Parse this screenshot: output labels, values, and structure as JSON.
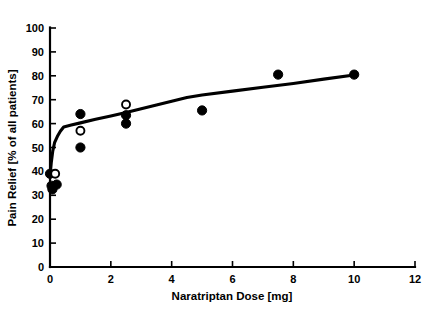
{
  "chart_data": {
    "type": "scatter",
    "title": "",
    "xlabel": "Naratriptan Dose [mg]",
    "ylabel": "Pain Relief [% of all patients]",
    "xlim": [
      0,
      12
    ],
    "ylim": [
      0,
      100
    ],
    "xticks": [
      0,
      2,
      4,
      6,
      8,
      10,
      12
    ],
    "yticks": [
      0,
      10,
      20,
      30,
      40,
      50,
      60,
      70,
      80,
      90,
      100
    ],
    "xtick_labels": [
      "0",
      "2",
      "4",
      "6",
      "8",
      "10",
      "12"
    ],
    "ytick_labels": [
      "0",
      "10",
      "20",
      "30",
      "40",
      "50",
      "60",
      "70",
      "80",
      "90",
      "100"
    ],
    "grid": false,
    "legend": null,
    "series": [
      {
        "name": "filled-circles",
        "marker": "filled-circle",
        "points": [
          {
            "x": 0.0,
            "y": 39.0
          },
          {
            "x": 0.05,
            "y": 34.0
          },
          {
            "x": 0.08,
            "y": 32.5
          },
          {
            "x": 0.22,
            "y": 34.5
          },
          {
            "x": 1.0,
            "y": 64.0
          },
          {
            "x": 1.0,
            "y": 50.0
          },
          {
            "x": 2.5,
            "y": 63.5
          },
          {
            "x": 2.5,
            "y": 60.0
          },
          {
            "x": 5.0,
            "y": 65.5
          },
          {
            "x": 7.5,
            "y": 80.5
          },
          {
            "x": 10.0,
            "y": 80.5
          }
        ]
      },
      {
        "name": "open-circles",
        "marker": "open-circle",
        "points": [
          {
            "x": 0.17,
            "y": 39.0
          },
          {
            "x": 1.0,
            "y": 57.0
          },
          {
            "x": 2.5,
            "y": 68.0
          }
        ]
      }
    ],
    "fit_curve": {
      "name": "fitted-dose-response-curve",
      "points": [
        {
          "x": 0.0,
          "y": 38.0
        },
        {
          "x": 0.04,
          "y": 43.5
        },
        {
          "x": 0.09,
          "y": 48.5
        },
        {
          "x": 0.15,
          "y": 52.0
        },
        {
          "x": 0.24,
          "y": 54.6
        },
        {
          "x": 0.34,
          "y": 56.8
        },
        {
          "x": 0.45,
          "y": 58.6
        },
        {
          "x": 0.7,
          "y": 59.4
        },
        {
          "x": 1.0,
          "y": 60.3
        },
        {
          "x": 1.5,
          "y": 61.8
        },
        {
          "x": 2.0,
          "y": 63.2
        },
        {
          "x": 2.5,
          "y": 64.6
        },
        {
          "x": 3.0,
          "y": 66.2
        },
        {
          "x": 3.5,
          "y": 67.8
        },
        {
          "x": 4.0,
          "y": 69.4
        },
        {
          "x": 4.5,
          "y": 70.9
        },
        {
          "x": 5.0,
          "y": 72.0
        },
        {
          "x": 6.0,
          "y": 73.6
        },
        {
          "x": 7.0,
          "y": 75.2
        },
        {
          "x": 8.0,
          "y": 76.8
        },
        {
          "x": 9.0,
          "y": 78.6
        },
        {
          "x": 10.0,
          "y": 80.3
        }
      ]
    }
  }
}
